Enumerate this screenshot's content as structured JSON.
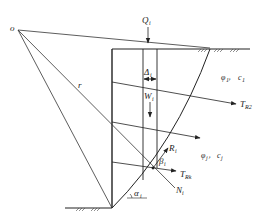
{
  "diagram": {
    "labels": {
      "center": "o",
      "radius": "r",
      "load": "Q",
      "load_sub": "i",
      "slice_width": "Δ",
      "slice_width_sub": "i",
      "weight": "W",
      "weight_sub": "i",
      "anchor_force_2": "T",
      "anchor_force_2_sub": "R2",
      "anchor_force_k": "T",
      "anchor_force_k_sub": "Rk",
      "resultant": "R",
      "resultant_sub": "i",
      "beta": "β",
      "beta_sub": "i",
      "alpha": "α",
      "alpha_sub": "i",
      "normal": "N",
      "normal_sub": "i",
      "layer1_phi": "φ",
      "layer1_phi_sub": "1",
      "layer1_sep": "，",
      "layer1_c": "c",
      "layer1_c_sub": "1",
      "layerj_phi": "φ",
      "layerj_phi_sub": "j",
      "layerj_sep": "，",
      "layerj_c": "c",
      "layerj_c_sub": "j"
    },
    "colors": {
      "line": "#222222",
      "background": "#ffffff"
    }
  }
}
